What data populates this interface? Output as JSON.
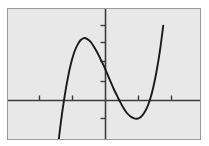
{
  "figure": {
    "title": "",
    "background_color": "#ffffff",
    "plot_area_color": "#e8e8e8",
    "frame_color": "#9a9a9a",
    "axis_color": "#3c3c3c",
    "curve_color": "#1a1a1a",
    "width": 209,
    "height": 146
  },
  "chart_data": {
    "type": "line",
    "title": "",
    "xlabel": "",
    "ylabel": "",
    "grid": false,
    "legend": "none",
    "xlim": [
      -5,
      5
    ],
    "ylim": [
      -4,
      6
    ],
    "x_ticks": [
      -4,
      -2,
      2,
      4
    ],
    "y_ticks": [
      -2,
      1,
      2,
      3,
      4
    ],
    "x_axis_y_value": 0,
    "y_axis_x_value": 0,
    "series": [
      {
        "name": "cubic",
        "x": [
          -3.05,
          -2.9,
          -2.7,
          -2.5,
          -2.3,
          -2.1,
          -1.9,
          -1.7,
          -1.5,
          -1.3,
          -1.1,
          -0.9,
          -0.7,
          -0.5,
          -0.3,
          -0.1,
          0.1,
          0.3,
          0.5,
          0.7,
          0.9,
          1.1,
          1.3,
          1.5,
          1.7,
          1.9,
          2.1,
          2.3,
          2.5,
          2.7,
          2.9,
          3.1,
          3.3,
          3.5
        ],
        "y": [
          -3.9,
          -2.55,
          -1.1,
          0.1,
          1.1,
          1.9,
          2.5,
          2.9,
          3.15,
          3.25,
          3.2,
          3.05,
          2.8,
          2.5,
          2.15,
          1.8,
          1.4,
          1.0,
          0.6,
          0.25,
          -0.1,
          -0.4,
          -0.65,
          -0.82,
          -0.92,
          -0.95,
          -0.88,
          -0.7,
          -0.4,
          0.05,
          0.7,
          1.55,
          2.6,
          3.9
        ]
      }
    ],
    "key_points": {
      "local_maximum": {
        "x": -1.25,
        "y": 3.27
      },
      "local_minimum": {
        "x": 1.95,
        "y": -0.95
      },
      "x_intercepts": [
        -2.55,
        0.82,
        2.68
      ]
    }
  },
  "elements": {
    "plot_frame_name": "plot-frame",
    "x_axis_name": "x-axis",
    "y_axis_name": "y-axis",
    "curve_name": "cubic-curve"
  }
}
